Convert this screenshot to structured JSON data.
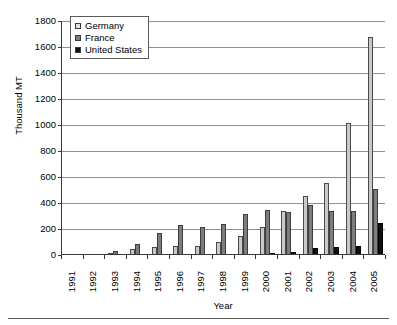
{
  "chart_data": {
    "type": "bar",
    "title": "",
    "xlabel": "Year",
    "ylabel": "Thousand MT",
    "ylim": [
      0,
      1800
    ],
    "ytick_step": 200,
    "yticks": [
      0,
      200,
      400,
      600,
      800,
      1000,
      1200,
      1400,
      1600,
      1800
    ],
    "grid": true,
    "legend_position": "top-left",
    "categories": [
      "1991",
      "1992",
      "1993",
      "1994",
      "1995",
      "1996",
      "1997",
      "1998",
      "1999",
      "2000",
      "2001",
      "2002",
      "2003",
      "2004",
      "2005"
    ],
    "series": [
      {
        "name": "Germany",
        "color": "#c9c9c9",
        "values": [
          5,
          5,
          10,
          35,
          55,
          65,
          65,
          90,
          140,
          205,
          330,
          450,
          550,
          1010,
          1670
        ]
      },
      {
        "name": "France",
        "color": "#7d7d7d",
        "values": [
          2,
          5,
          20,
          75,
          160,
          225,
          210,
          230,
          310,
          340,
          325,
          380,
          330,
          330,
          500
        ]
      },
      {
        "name": "United States",
        "color": "#101010",
        "values": [
          0,
          0,
          0,
          0,
          0,
          0,
          0,
          0,
          2,
          8,
          12,
          45,
          55,
          65,
          240
        ]
      }
    ]
  },
  "legend": {
    "items": [
      {
        "label": "Germany",
        "key": "germany"
      },
      {
        "label": "France",
        "key": "france"
      },
      {
        "label": "United States",
        "key": "us"
      }
    ]
  }
}
